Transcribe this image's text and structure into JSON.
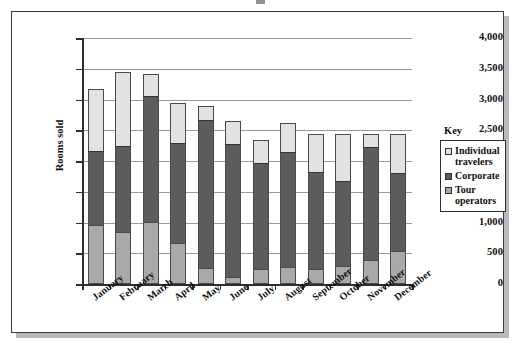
{
  "chart_data": {
    "type": "bar",
    "subtype": "stacked-bar",
    "title": "",
    "xlabel": "",
    "ylabel": "Rooms sold",
    "ylim": [
      0,
      4000
    ],
    "ytick_values": [
      0,
      500,
      1000,
      1500,
      2000,
      2500,
      3000,
      3500,
      4000
    ],
    "ytick_labels": [
      "0",
      "500",
      "1,000",
      "1,500",
      "2,000",
      "2,500",
      "3,000",
      "3,500",
      "4,000"
    ],
    "grid": true,
    "legend_position": "right",
    "legend_title": "Key",
    "categories": [
      "January",
      "February",
      "March",
      "April",
      "May",
      "June",
      "July",
      "August",
      "September",
      "October",
      "November",
      "December"
    ],
    "series": [
      {
        "name": "Tour operators",
        "color": "#a9a9a9",
        "stack_order": 1,
        "values": [
          960,
          840,
          1010,
          660,
          260,
          120,
          250,
          270,
          250,
          300,
          390,
          540
        ]
      },
      {
        "name": "Corporate",
        "color": "#5c5c5c",
        "stack_order": 2,
        "values": [
          1210,
          1410,
          2050,
          1630,
          2400,
          2150,
          1710,
          1880,
          1570,
          1370,
          1830,
          1260
        ]
      },
      {
        "name": "Individual travelers",
        "color": "#e2e2e2",
        "stack_order": 3,
        "values": [
          1000,
          1200,
          360,
          660,
          240,
          380,
          380,
          470,
          620,
          770,
          220,
          640
        ]
      }
    ],
    "cumulative_tops": {
      "tour_operators": [
        960,
        840,
        1010,
        660,
        260,
        120,
        250,
        270,
        250,
        300,
        390,
        540
      ],
      "corporate": [
        2170,
        2250,
        3060,
        2290,
        2660,
        2270,
        1960,
        2150,
        1820,
        1670,
        2220,
        1800
      ],
      "total": [
        3170,
        3450,
        3420,
        2950,
        2900,
        2650,
        2340,
        2620,
        2440,
        2440,
        2440,
        2440
      ]
    }
  },
  "legend": {
    "title": "Key",
    "entries": [
      {
        "label_line1": "Individual",
        "label_line2": "travelers",
        "color": "#e2e2e2"
      },
      {
        "label_line1": "Corporate",
        "label_line2": "",
        "color": "#5c5c5c"
      },
      {
        "label_line1": "Tour",
        "label_line2": "operators",
        "color": "#a9a9a9"
      }
    ]
  },
  "axes": {
    "y_axis_title": "Rooms sold"
  }
}
